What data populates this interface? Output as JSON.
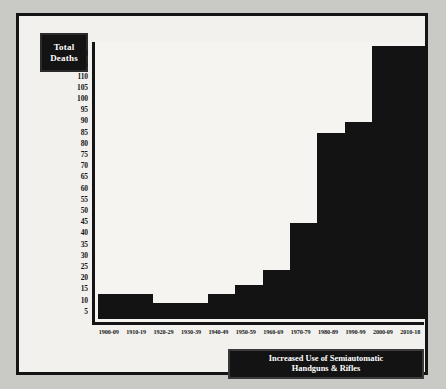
{
  "axis": {
    "y_title_line1": "Total",
    "y_title_line2": "Deaths"
  },
  "annotation": {
    "line1": "Increased Use of Semiautomatic",
    "line2": "Handguns & Rifles"
  },
  "chart_data": {
    "type": "bar",
    "title": "",
    "xlabel": "",
    "ylabel": "Total Deaths",
    "categories": [
      "1900-09",
      "1910-19",
      "1920-29",
      "1930-39",
      "1940-49",
      "1950-59",
      "1960-69",
      "1970-79",
      "1980-89",
      "1990-99",
      "2000-09",
      "2010-18"
    ],
    "values": [
      11,
      11,
      7,
      7,
      11,
      15,
      22,
      43,
      83,
      88,
      122,
      122
    ],
    "ylim": [
      0,
      125
    ],
    "yticks": [
      5,
      10,
      15,
      20,
      25,
      30,
      35,
      40,
      45,
      50,
      55,
      60,
      65,
      70,
      75,
      80,
      85,
      90,
      95,
      100,
      105,
      110,
      115,
      120
    ],
    "grid": false,
    "legend": null,
    "bar_color": "#131313",
    "background": "#f5f4f1",
    "annotations": [
      {
        "text": "Increased Use of Semiautomatic Handguns & Rifles",
        "position": "bottom-right"
      }
    ]
  }
}
